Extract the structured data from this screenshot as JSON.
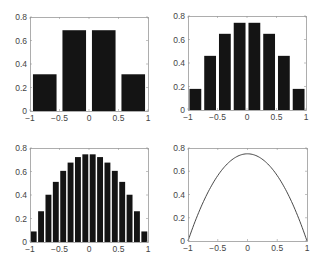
{
  "figure": {
    "width": 321,
    "height": 265,
    "background": "#ffffff",
    "bar_color": "#141414",
    "axis_color": "#999999",
    "line_color": "#333333"
  },
  "chart_data": [
    {
      "type": "bar",
      "title": "",
      "xlabel": "",
      "ylabel": "",
      "xlim": [
        -1,
        1
      ],
      "ylim": [
        0,
        0.8
      ],
      "grid": false,
      "bins": 4,
      "bin_edges": [
        -1,
        -0.5,
        0,
        0.5,
        1
      ],
      "x": [
        -0.75,
        -0.25,
        0.25,
        0.75
      ],
      "values": [
        0.3125,
        0.6875,
        0.6875,
        0.3125
      ],
      "xticks": [
        "-1",
        "-0.5",
        "0",
        "0.5",
        "1"
      ],
      "yticks": [
        "0",
        "0.2",
        "0.4",
        "0.6",
        "0.8"
      ],
      "box": {
        "left": 30,
        "top": 17,
        "right": 148,
        "bottom": 111
      }
    },
    {
      "type": "bar",
      "title": "",
      "xlabel": "",
      "ylabel": "",
      "xlim": [
        -1,
        1
      ],
      "ylim": [
        0,
        0.8
      ],
      "grid": false,
      "bins": 8,
      "x": [
        -0.875,
        -0.625,
        -0.375,
        -0.125,
        0.125,
        0.375,
        0.625,
        0.875
      ],
      "values": [
        0.1797,
        0.4609,
        0.6484,
        0.7422,
        0.7422,
        0.6484,
        0.4609,
        0.1797
      ],
      "xticks": [
        "-1",
        "-0.5",
        "0",
        "0.5",
        "1"
      ],
      "yticks": [
        "0",
        "0.2",
        "0.4",
        "0.6",
        "0.8"
      ],
      "box": {
        "left": 188,
        "top": 16,
        "right": 306,
        "bottom": 110
      }
    },
    {
      "type": "bar",
      "title": "",
      "xlabel": "",
      "ylabel": "",
      "xlim": [
        -1,
        1
      ],
      "ylim": [
        0,
        0.8
      ],
      "grid": false,
      "bins": 16,
      "x": [
        -0.9375,
        -0.8125,
        -0.6875,
        -0.5625,
        -0.4375,
        -0.3125,
        -0.1875,
        -0.0625,
        0.0625,
        0.1875,
        0.3125,
        0.4375,
        0.5625,
        0.6875,
        0.8125,
        0.9375
      ],
      "values": [
        0.0898,
        0.2617,
        0.4023,
        0.5117,
        0.6055,
        0.6758,
        0.7227,
        0.7461,
        0.7461,
        0.7227,
        0.6758,
        0.6055,
        0.5117,
        0.4023,
        0.2617,
        0.0898
      ],
      "xticks": [
        "-1",
        "-0.5",
        "0",
        "0.5",
        "1"
      ],
      "yticks": [
        "0",
        "0.2",
        "0.4",
        "0.6",
        "0.8"
      ],
      "box": {
        "left": 30,
        "top": 148,
        "right": 148,
        "bottom": 242
      }
    },
    {
      "type": "line",
      "title": "",
      "xlabel": "",
      "ylabel": "",
      "xlim": [
        -1,
        1
      ],
      "ylim": [
        0,
        0.8
      ],
      "grid": false,
      "function": "0.75*(1-x^2)",
      "x": [
        -1,
        -0.75,
        -0.5,
        -0.25,
        0,
        0.25,
        0.5,
        0.75,
        1
      ],
      "values": [
        0,
        0.328,
        0.5625,
        0.703,
        0.75,
        0.703,
        0.5625,
        0.328,
        0
      ],
      "xticks": [
        "-1",
        "-0.5",
        "0",
        "0.5",
        "1"
      ],
      "yticks": [
        "0",
        "0.2",
        "0.4",
        "0.6",
        "0.8"
      ],
      "box": {
        "left": 188,
        "top": 148,
        "right": 307,
        "bottom": 241
      }
    }
  ]
}
